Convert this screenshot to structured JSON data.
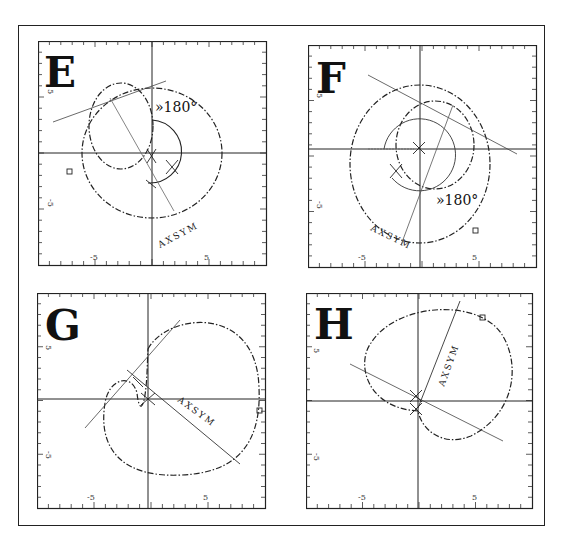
{
  "header": {
    "text": "— — —   — — —   ·· 459"
  },
  "figure": {
    "axis_range": [
      -10,
      10
    ],
    "tick_labels": {
      "neg": "-5",
      "pos": "5"
    },
    "panels": [
      {
        "id": "E",
        "label": "E",
        "annotation": "»180°",
        "axis_label": "AXSYM"
      },
      {
        "id": "F",
        "label": "F",
        "annotation": "»180°",
        "axis_label": "AXSYM"
      },
      {
        "id": "G",
        "label": "G",
        "annotation": "",
        "axis_label": "AXSYM"
      },
      {
        "id": "H",
        "label": "H",
        "annotation": "",
        "axis_label": "AXSYM"
      }
    ]
  }
}
